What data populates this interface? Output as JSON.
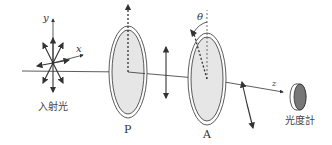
{
  "diagram": {
    "title": "",
    "labels": {
      "incident_light": "入射光",
      "polarizer": "P",
      "analyzer": "A",
      "photometer": "光度計",
      "axis_x": "x",
      "axis_y": "y",
      "axis_z": "z",
      "angle": "θ"
    },
    "components": [
      {
        "id": "incident-light",
        "label": "入射光",
        "type": "unpolarized light source"
      },
      {
        "id": "polarizer",
        "label": "P",
        "type": "polarizer",
        "transmission_axis": "vertical"
      },
      {
        "id": "analyzer",
        "label": "A",
        "type": "analyzer",
        "transmission_axis": "rotated by θ from vertical"
      },
      {
        "id": "photometer",
        "label": "光度計",
        "type": "detector"
      }
    ],
    "colors": {
      "line": "#333333",
      "filter_fill": "#e6e6e6",
      "detector_face": "#777777"
    }
  }
}
